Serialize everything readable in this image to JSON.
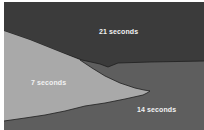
{
  "diagram": {
    "colors": {
      "background": "#ffffff",
      "dark_region": "#3b3b3b",
      "mid_region": "#5e5e5e",
      "light_region": "#a9a9a9",
      "boundary": "#1e1e1e",
      "label_text": "#f2f2f2"
    },
    "regions": [
      {
        "id": "top",
        "label": "21 seconds"
      },
      {
        "id": "left-wedge",
        "label": "7 seconds"
      },
      {
        "id": "bottom-right",
        "label": "14 seconds"
      }
    ]
  }
}
